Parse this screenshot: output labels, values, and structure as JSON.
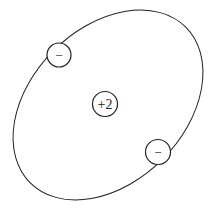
{
  "diagram": {
    "type": "atom-model",
    "nucleus": {
      "label": "+2",
      "cx": 105,
      "cy": 104,
      "r": 12.5
    },
    "orbit": {
      "cx": 108,
      "cy": 105,
      "rx": 110,
      "ry": 77,
      "rotation": -45
    },
    "electrons": [
      {
        "label": "−",
        "cx": 59,
        "cy": 55,
        "r": 12
      },
      {
        "label": "−",
        "cx": 158,
        "cy": 152,
        "r": 12.5
      }
    ],
    "colors": {
      "stroke": "#222222",
      "background": "#ffffff"
    }
  }
}
